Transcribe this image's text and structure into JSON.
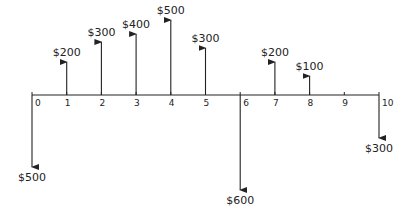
{
  "diagram": {
    "type": "cash-flow diagram",
    "periods": [
      "0",
      "1",
      "2",
      "3",
      "4",
      "5",
      "6",
      "7",
      "8",
      "9",
      "10"
    ],
    "flows": [
      {
        "period": 0,
        "direction": "down",
        "label": "$500",
        "value": -500
      },
      {
        "period": 1,
        "direction": "up",
        "label": "$200",
        "value": 200
      },
      {
        "period": 2,
        "direction": "up",
        "label": "$300",
        "value": 300
      },
      {
        "period": 3,
        "direction": "up",
        "label": "$400",
        "value": 400
      },
      {
        "period": 4,
        "direction": "up",
        "label": "$500",
        "value": 500
      },
      {
        "period": 5,
        "direction": "up",
        "label": "$300",
        "value": 300
      },
      {
        "period": 6,
        "direction": "down",
        "label": "$600",
        "value": -600
      },
      {
        "period": 7,
        "direction": "up",
        "label": "$200",
        "value": 200
      },
      {
        "period": 8,
        "direction": "up",
        "label": "$100",
        "value": 100
      },
      {
        "period": 10,
        "direction": "down",
        "label": "$300",
        "value": -300
      }
    ],
    "color": "#222222"
  }
}
